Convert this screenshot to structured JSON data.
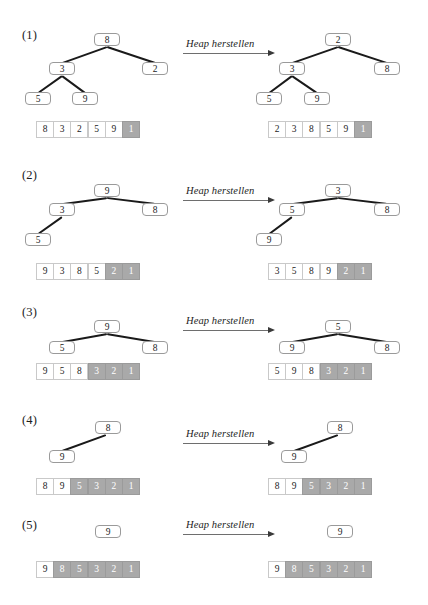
{
  "figure": {
    "title_text_style": "heap-sort step diagram",
    "arrow_label": "Heap herstellen",
    "steps": [
      {
        "label": "(1)",
        "left": {
          "nodes": [
            {
              "value": "8",
              "x": 94,
              "y": 33
            },
            {
              "value": "3",
              "x": 49,
              "y": 62
            },
            {
              "value": "2",
              "x": 142,
              "y": 62
            },
            {
              "value": "5",
              "x": 25,
              "y": 92
            },
            {
              "value": "9",
              "x": 72,
              "y": 92
            }
          ],
          "edges": [
            {
              "x1": 107,
              "y1": 46,
              "x2": 62,
              "y2": 62
            },
            {
              "x1": 107,
              "y1": 46,
              "x2": 155,
              "y2": 62
            },
            {
              "x1": 62,
              "y1": 75,
              "x2": 38,
              "y2": 92
            },
            {
              "x1": 62,
              "y1": 75,
              "x2": 85,
              "y2": 92
            }
          ],
          "array": {
            "x": 36,
            "y": 121,
            "cells": [
              "8",
              "3",
              "2",
              "5",
              "9",
              "1"
            ],
            "shaded": [
              5
            ]
          }
        },
        "right": {
          "nodes": [
            {
              "value": "2",
              "x": 325,
              "y": 33
            },
            {
              "value": "3",
              "x": 279,
              "y": 62
            },
            {
              "value": "8",
              "x": 374,
              "y": 62
            },
            {
              "value": "5",
              "x": 256,
              "y": 92
            },
            {
              "value": "9",
              "x": 304,
              "y": 92
            }
          ],
          "edges": [
            {
              "x1": 338,
              "y1": 46,
              "x2": 292,
              "y2": 62
            },
            {
              "x1": 338,
              "y1": 46,
              "x2": 387,
              "y2": 62
            },
            {
              "x1": 292,
              "y1": 75,
              "x2": 269,
              "y2": 92
            },
            {
              "x1": 292,
              "y1": 75,
              "x2": 317,
              "y2": 92
            }
          ],
          "array": {
            "x": 268,
            "y": 121,
            "cells": [
              "2",
              "3",
              "8",
              "5",
              "9",
              "1"
            ],
            "shaded": [
              5
            ]
          }
        },
        "arrow": {
          "x": 183,
          "y": 53
        },
        "label_pos": {
          "x": 22,
          "y": 28
        }
      },
      {
        "label": "(2)",
        "left": {
          "nodes": [
            {
              "value": "9",
              "x": 94,
              "y": 184
            },
            {
              "value": "3",
              "x": 49,
              "y": 203
            },
            {
              "value": "8",
              "x": 142,
              "y": 203
            },
            {
              "value": "5",
              "x": 25,
              "y": 233
            }
          ],
          "edges": [
            {
              "x1": 107,
              "y1": 197,
              "x2": 62,
              "y2": 203
            },
            {
              "x1": 107,
              "y1": 197,
              "x2": 155,
              "y2": 203
            },
            {
              "x1": 62,
              "y1": 216,
              "x2": 38,
              "y2": 233
            }
          ],
          "array": {
            "x": 36,
            "y": 263,
            "cells": [
              "9",
              "3",
              "8",
              "5",
              "2",
              "1"
            ],
            "shaded": [
              4,
              5
            ]
          }
        },
        "right": {
          "nodes": [
            {
              "value": "3",
              "x": 325,
              "y": 184
            },
            {
              "value": "5",
              "x": 279,
              "y": 203
            },
            {
              "value": "8",
              "x": 374,
              "y": 203
            },
            {
              "value": "9",
              "x": 256,
              "y": 233
            }
          ],
          "edges": [
            {
              "x1": 338,
              "y1": 197,
              "x2": 292,
              "y2": 203
            },
            {
              "x1": 338,
              "y1": 197,
              "x2": 387,
              "y2": 203
            },
            {
              "x1": 292,
              "y1": 216,
              "x2": 269,
              "y2": 233
            }
          ],
          "array": {
            "x": 268,
            "y": 263,
            "cells": [
              "3",
              "5",
              "8",
              "9",
              "2",
              "1"
            ],
            "shaded": [
              4,
              5
            ]
          }
        },
        "arrow": {
          "x": 183,
          "y": 200
        },
        "label_pos": {
          "x": 22,
          "y": 168
        }
      },
      {
        "label": "(3)",
        "left": {
          "nodes": [
            {
              "value": "9",
              "x": 94,
              "y": 320
            },
            {
              "value": "5",
              "x": 49,
              "y": 341
            },
            {
              "value": "8",
              "x": 142,
              "y": 341
            }
          ],
          "edges": [
            {
              "x1": 107,
              "y1": 333,
              "x2": 62,
              "y2": 341
            },
            {
              "x1": 107,
              "y1": 333,
              "x2": 155,
              "y2": 341
            }
          ],
          "array": {
            "x": 36,
            "y": 363,
            "cells": [
              "9",
              "5",
              "8",
              "3",
              "2",
              "1"
            ],
            "shaded": [
              3,
              4,
              5
            ]
          }
        },
        "right": {
          "nodes": [
            {
              "value": "5",
              "x": 325,
              "y": 320
            },
            {
              "value": "9",
              "x": 279,
              "y": 341
            },
            {
              "value": "8",
              "x": 374,
              "y": 341
            }
          ],
          "edges": [
            {
              "x1": 338,
              "y1": 333,
              "x2": 292,
              "y2": 341
            },
            {
              "x1": 338,
              "y1": 333,
              "x2": 387,
              "y2": 341
            }
          ],
          "array": {
            "x": 268,
            "y": 363,
            "cells": [
              "5",
              "9",
              "8",
              "3",
              "2",
              "1"
            ],
            "shaded": [
              3,
              4,
              5
            ]
          }
        },
        "arrow": {
          "x": 183,
          "y": 330
        },
        "label_pos": {
          "x": 22,
          "y": 305
        }
      },
      {
        "label": "(4)",
        "left": {
          "nodes": [
            {
              "value": "8",
              "x": 95,
              "y": 421
            },
            {
              "value": "9",
              "x": 49,
              "y": 450
            }
          ],
          "edges": [
            {
              "x1": 106,
              "y1": 434,
              "x2": 62,
              "y2": 450
            }
          ],
          "array": {
            "x": 36,
            "y": 478,
            "cells": [
              "8",
              "9",
              "5",
              "3",
              "2",
              "1"
            ],
            "shaded": [
              2,
              3,
              4,
              5
            ]
          }
        },
        "right": {
          "nodes": [
            {
              "value": "8",
              "x": 327,
              "y": 421
            },
            {
              "value": "9",
              "x": 281,
              "y": 450
            }
          ],
          "edges": [
            {
              "x1": 338,
              "y1": 434,
              "x2": 294,
              "y2": 450
            }
          ],
          "array": {
            "x": 268,
            "y": 478,
            "cells": [
              "8",
              "9",
              "5",
              "3",
              "2",
              "1"
            ],
            "shaded": [
              2,
              3,
              4,
              5
            ]
          }
        },
        "arrow": {
          "x": 183,
          "y": 443
        },
        "label_pos": {
          "x": 22,
          "y": 413
        }
      },
      {
        "label": "(5)",
        "left": {
          "nodes": [
            {
              "value": "9",
              "x": 95,
              "y": 525
            }
          ],
          "edges": [],
          "array": {
            "x": 36,
            "y": 561,
            "cells": [
              "9",
              "8",
              "5",
              "3",
              "2",
              "1"
            ],
            "shaded": [
              1,
              2,
              3,
              4,
              5
            ]
          }
        },
        "right": {
          "nodes": [
            {
              "value": "9",
              "x": 327,
              "y": 525
            }
          ],
          "edges": [],
          "array": {
            "x": 268,
            "y": 561,
            "cells": [
              "9",
              "8",
              "5",
              "3",
              "2",
              "1"
            ],
            "shaded": [
              1,
              2,
              3,
              4,
              5
            ]
          }
        },
        "arrow": {
          "x": 183,
          "y": 534
        },
        "label_pos": {
          "x": 22,
          "y": 518
        }
      }
    ]
  },
  "colors": {
    "shaded_cell": "#a9a9a9",
    "cell_border": "#c9c9c9",
    "node_border": "#9a9a9a",
    "edge": "#1a1a1a",
    "text": "#1c1c1c",
    "arrow_line": "#6e6e6e"
  }
}
